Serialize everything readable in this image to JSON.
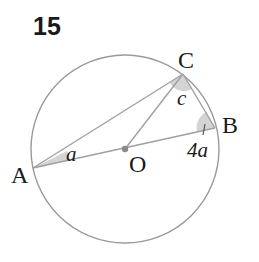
{
  "problem": {
    "number": "15"
  },
  "diagram": {
    "circle": {
      "center": "O",
      "stroke": "#9a9a9a"
    },
    "points": {
      "A": "A",
      "B": "B",
      "C": "C",
      "O": "O"
    },
    "angles": {
      "at_A": "a",
      "at_B": "4a",
      "at_C": "c"
    },
    "segments": [
      "AC",
      "CB",
      "AB",
      "OC"
    ],
    "colors": {
      "line": "#a0a0a0",
      "angle_fill": "#d4d4d4",
      "center_dot": "#8a8a8a",
      "text": "#1a1a1a"
    }
  }
}
